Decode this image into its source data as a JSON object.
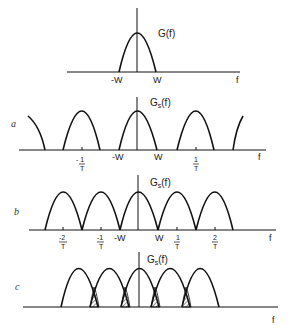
{
  "figure": {
    "ink_color": "#111111",
    "background": "#ffffff",
    "panels": [
      {
        "id": "original",
        "tag": "",
        "function_label": "G(f)",
        "axis_label": "f",
        "tick_labels": [
          "-W",
          "W"
        ],
        "description": "Band-limited spectrum G(f) occupying -W to W"
      },
      {
        "id": "a",
        "tag": "a",
        "function_label": "Gs(f)",
        "function_base": "G",
        "function_sub": "s",
        "function_arg": "(f)",
        "axis_label": "f",
        "tick_labels": [
          "-1/T",
          "-W",
          "W",
          "1/T"
        ],
        "description": "Oversampled: spectral replicas separated by gaps"
      },
      {
        "id": "b",
        "tag": "b",
        "function_label": "Gs(f)",
        "function_base": "G",
        "function_sub": "s",
        "function_arg": "(f)",
        "axis_label": "f",
        "tick_labels": [
          "-2/T",
          "-1/T",
          "-W",
          "W",
          "1/T",
          "2/T"
        ],
        "description": "Nyquist-rate sampling: replicas just touch"
      },
      {
        "id": "c",
        "tag": "c",
        "function_label": "Gs(f)",
        "function_base": "G",
        "function_sub": "s",
        "function_arg": "(f)",
        "axis_label": "f",
        "tick_labels": [],
        "description": "Undersampled: overlapping replicas cause aliasing (hatched regions)"
      }
    ],
    "labels": {
      "g": "G(f)",
      "gs_base": "G",
      "gs_sub": "s",
      "gs_arg": "(f)",
      "f": "f",
      "minus_w": "-W",
      "w": "W",
      "tag_a": "a",
      "tag_b": "b",
      "tag_c": "c",
      "frac_minus_one_num": "- 1",
      "frac_one_num": "1",
      "frac_minus_two_num": "-2",
      "frac_minus_one_num_b": "-1",
      "frac_two_num": "2",
      "frac_den": "T"
    }
  }
}
